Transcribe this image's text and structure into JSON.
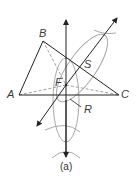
{
  "diagram": {
    "points": {
      "A": {
        "label": "A",
        "x": 19,
        "y": 95
      },
      "B": {
        "label": "B",
        "x": 43,
        "y": 41
      },
      "C": {
        "label": "C",
        "x": 119,
        "y": 95
      },
      "F": {
        "label": "F",
        "x": 66,
        "y": 85
      },
      "S": {
        "label": "S",
        "x": 83,
        "y": 62
      },
      "R": {
        "label": "R",
        "x": 66,
        "y": 97
      }
    },
    "caption": "(a)",
    "colors": {
      "line": "#222222",
      "arc": "#aaaaaa",
      "dashed": "#888888"
    }
  }
}
